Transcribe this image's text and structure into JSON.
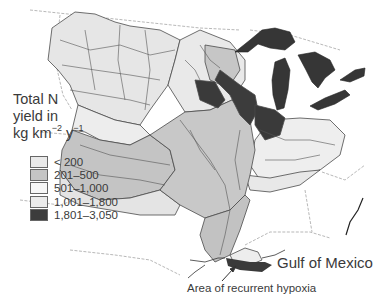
{
  "map": {
    "title_line1": "Total N",
    "title_line2": "yield in",
    "title_unit_kg": "kg km",
    "title_unit_exp1": "−2",
    "title_unit_y": " y",
    "title_unit_exp2": "−1",
    "region": "Mississippi–Atchafalaya River Basin",
    "labels": {
      "gulf": "Gulf of Mexico",
      "hypoxia": "Area of recurrent hypoxia"
    },
    "colors": {
      "water_bodies": "#3a3a3a",
      "state_border": "#8a8a8a",
      "basin_line": "#4a4a4a"
    }
  },
  "legend": {
    "items": [
      {
        "label": "< 200",
        "color": "#e9e9e9"
      },
      {
        "label": "201–500",
        "color": "#c4c4c4"
      },
      {
        "label": "501–1,000",
        "color": "#f6f6f6"
      },
      {
        "label": "1,001–1,800",
        "color": "#ebebeb"
      },
      {
        "label": "1,801–3,050",
        "color": "#3c3c3c"
      }
    ]
  }
}
